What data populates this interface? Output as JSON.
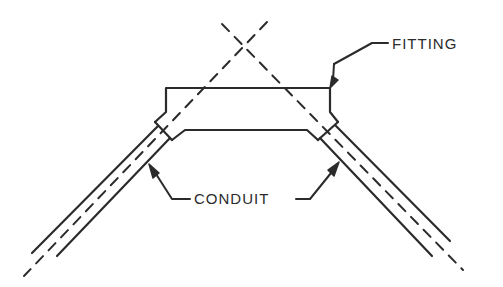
{
  "diagram": {
    "type": "technical-line-drawing",
    "labels": {
      "fitting": "FITTING",
      "conduit": "CONDUIT"
    },
    "colors": {
      "stroke": "#2b2b2b",
      "background": "#ffffff"
    }
  }
}
